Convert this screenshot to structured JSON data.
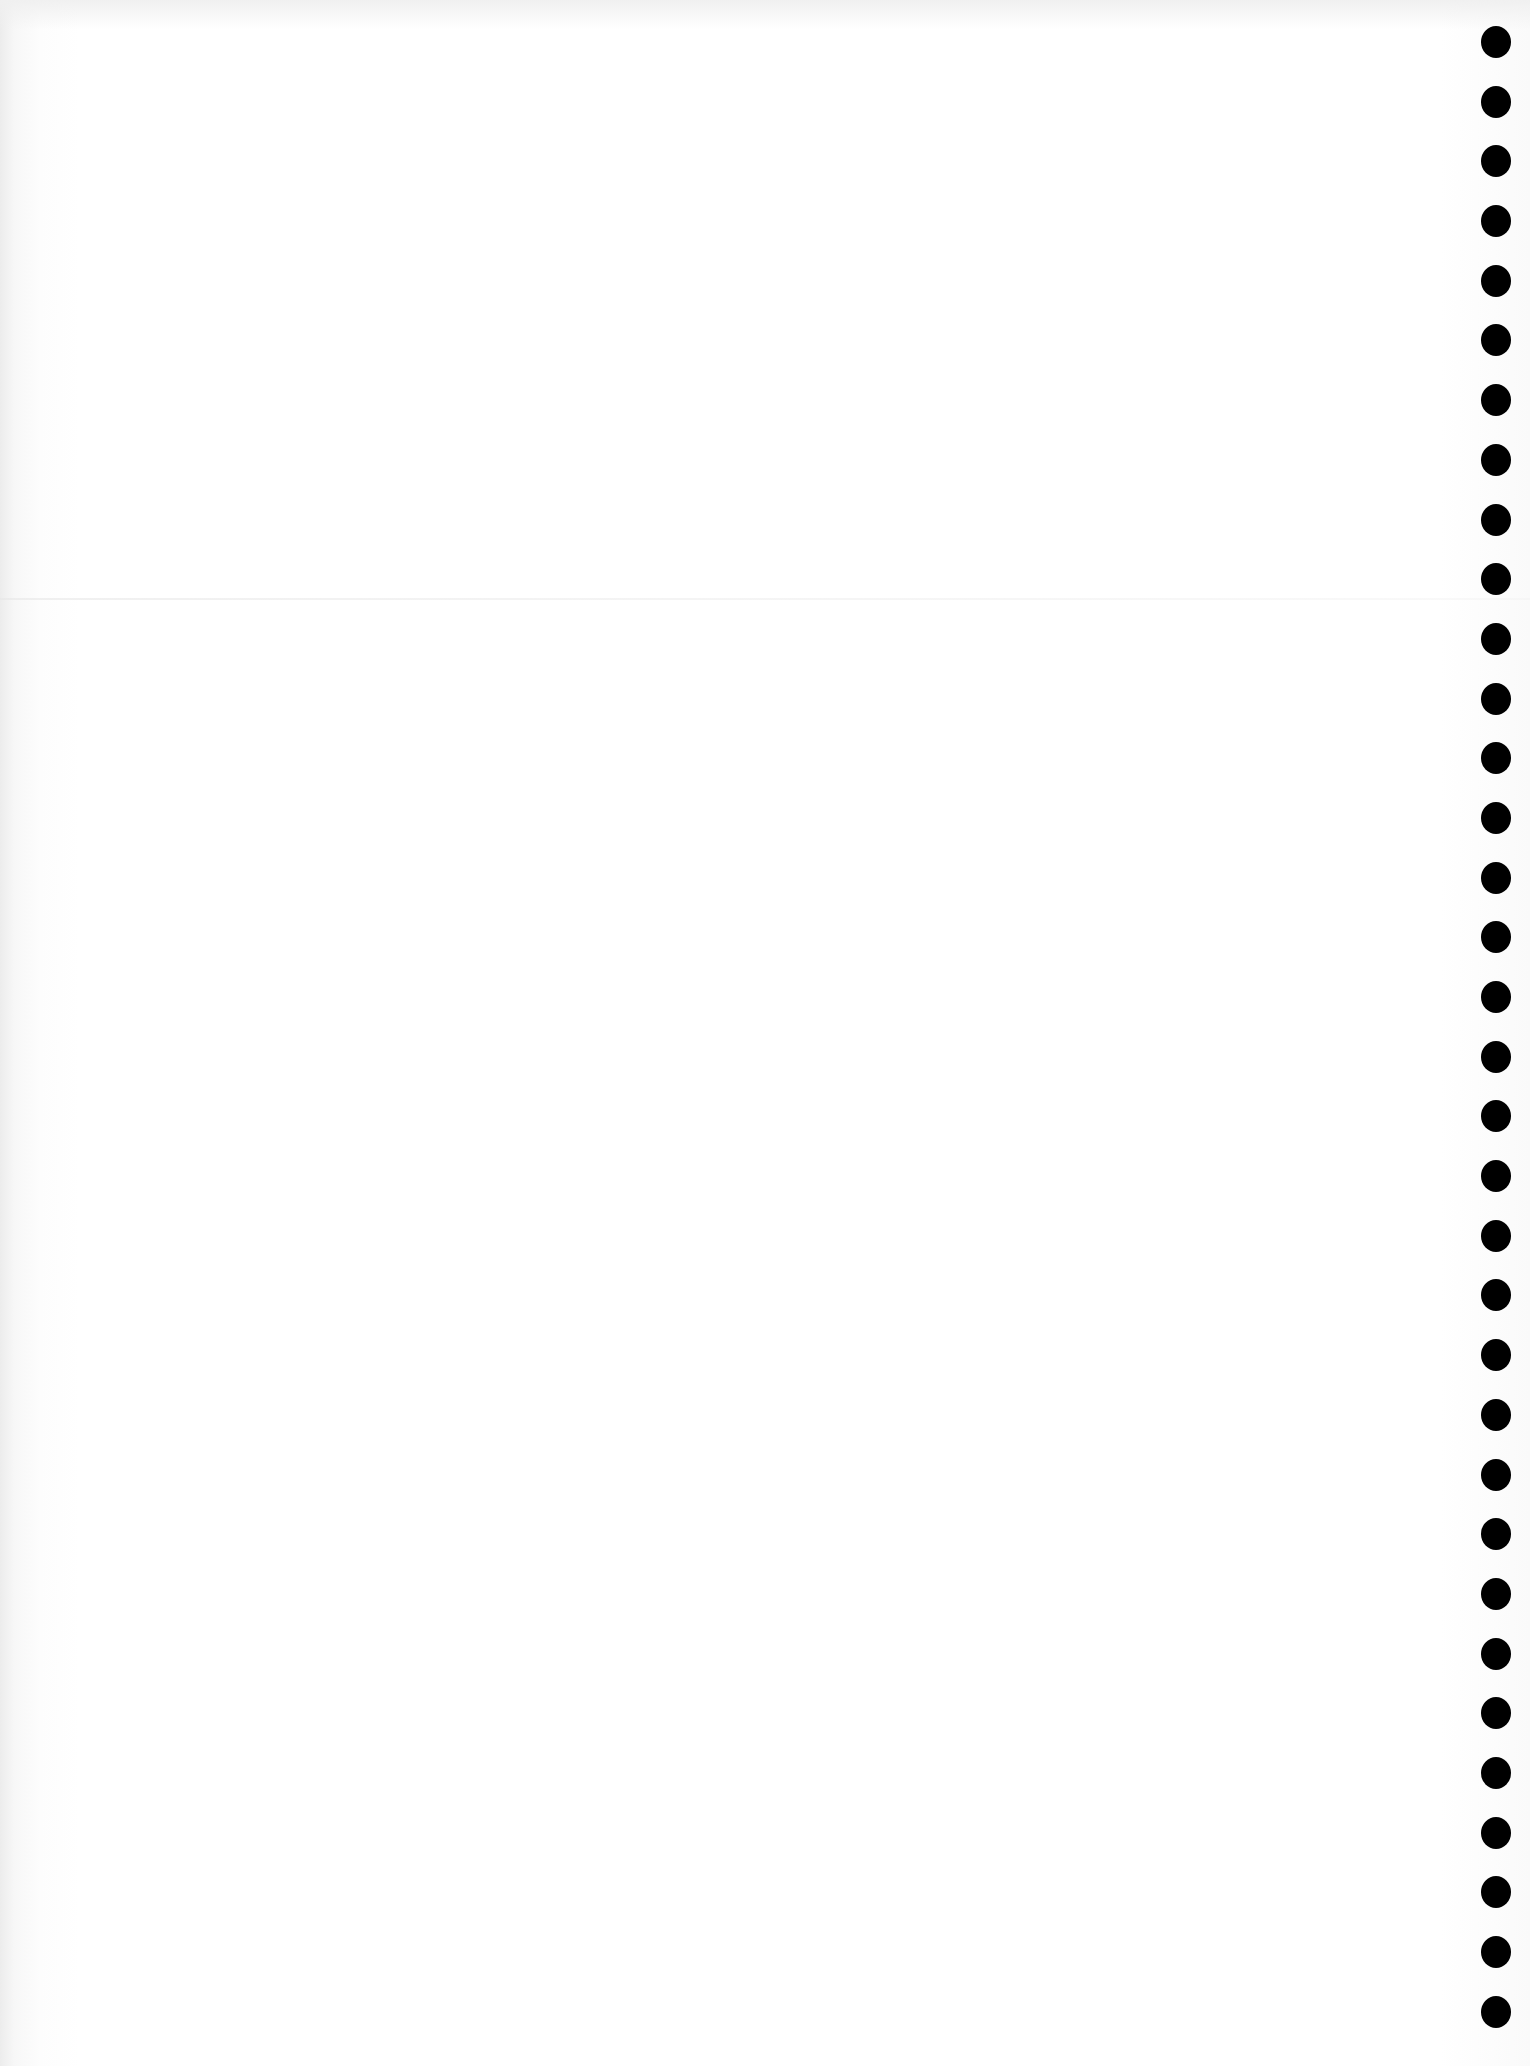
{
  "page": {
    "type": "blank-punched-sheet",
    "background_color": "#ffffff",
    "hole_color": "#000000",
    "hole_count": 34,
    "text_content": ""
  }
}
